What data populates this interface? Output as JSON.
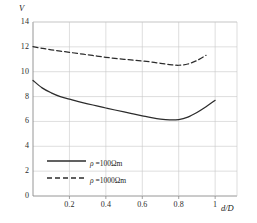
{
  "chart_data": {
    "type": "line",
    "title": "",
    "xlabel": "d/D",
    "ylabel": "V",
    "xlim": [
      0,
      1.12
    ],
    "ylim": [
      0,
      14
    ],
    "grid": true,
    "legend_position": "lower-left-inside",
    "x_ticks": [
      "0.2",
      "0.4",
      "0.6",
      "0.8",
      "1"
    ],
    "x_tick_values": [
      0.2,
      0.4,
      0.6,
      0.8,
      1.0
    ],
    "y_ticks": [
      "0",
      "2",
      "4",
      "6",
      "8",
      "10",
      "12",
      "14"
    ],
    "y_tick_values": [
      0,
      2,
      4,
      6,
      8,
      10,
      12,
      14
    ],
    "series": [
      {
        "name": "ρ =100Ωm",
        "style": "solid",
        "color": "#2c2c2c",
        "x": [
          0.0,
          0.05,
          0.1,
          0.15,
          0.2,
          0.25,
          0.3,
          0.35,
          0.4,
          0.45,
          0.5,
          0.55,
          0.6,
          0.65,
          0.7,
          0.75,
          0.8,
          0.85,
          0.9,
          0.95,
          1.0
        ],
        "y": [
          9.3,
          8.7,
          8.3,
          8.0,
          7.8,
          7.6,
          7.42,
          7.25,
          7.08,
          6.92,
          6.76,
          6.6,
          6.45,
          6.3,
          6.18,
          6.12,
          6.15,
          6.35,
          6.72,
          7.18,
          7.7
        ]
      },
      {
        "name": "ρ =1000Ωm",
        "style": "dashed",
        "color": "#2c2c2c",
        "x": [
          0.0,
          0.05,
          0.1,
          0.15,
          0.2,
          0.25,
          0.3,
          0.35,
          0.4,
          0.45,
          0.5,
          0.55,
          0.6,
          0.65,
          0.7,
          0.75,
          0.8,
          0.85,
          0.9,
          0.95
        ],
        "y": [
          12.02,
          11.88,
          11.76,
          11.66,
          11.56,
          11.46,
          11.36,
          11.26,
          11.16,
          11.07,
          11.0,
          10.93,
          10.86,
          10.78,
          10.68,
          10.58,
          10.52,
          10.62,
          10.9,
          11.32
        ]
      }
    ]
  },
  "legend": {
    "entries": [
      {
        "label_rho": "ρ",
        "label_rest": " =100Ωm",
        "style": "solid"
      },
      {
        "label_rho": "ρ",
        "label_rest": " =1000Ωm",
        "style": "dashed"
      }
    ]
  },
  "axes": {
    "y_axis_title": "V",
    "x_axis_title": "d/D"
  },
  "colors": {
    "curve": "#2c2c2c",
    "grid": "#c8c8c8",
    "axis": "#8a8a8a",
    "text": "#1a1a1a"
  }
}
